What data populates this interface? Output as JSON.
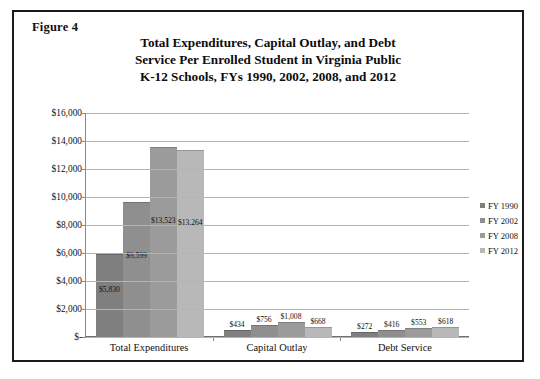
{
  "figure": {
    "label": "Figure 4",
    "title_lines": [
      "Total Expenditures, Capital Outlay, and Debt",
      "Service Per Enrolled Student in Virginia Public",
      "K-12 Schools,  FYs 1990, 2002, 2008, and 2012"
    ]
  },
  "legend": {
    "position": "right",
    "items": [
      {
        "label": "FY 1990",
        "color": "#7f7f7f"
      },
      {
        "label": "FY 2002",
        "color": "#8f8f8f"
      },
      {
        "label": "FY 2008",
        "color": "#9b9b9b"
      },
      {
        "label": "FY 2012",
        "color": "#b8b8b8"
      }
    ]
  },
  "chart_data": {
    "type": "bar",
    "title": "Total Expenditures, Capital Outlay, and Debt Service Per Enrolled Student in Virginia Public K-12 Schools,  FYs 1990, 2002, 2008, and 2012",
    "xlabel": "",
    "ylabel": "",
    "ylim": [
      0,
      16000
    ],
    "grid": true,
    "ytick_labels": [
      "$16,000",
      "$14,000",
      "$12,000",
      "$10,000",
      "$8,000",
      "$6,000",
      "$4,000",
      "$2,000",
      "$-"
    ],
    "ytick_values": [
      16000,
      14000,
      12000,
      10000,
      8000,
      6000,
      4000,
      2000,
      0
    ],
    "categories": [
      "Total Expenditures",
      "Capital Outlay",
      "Debt Service"
    ],
    "series": [
      {
        "name": "FY 1990",
        "color": "#7f7f7f",
        "values": [
          5830,
          434,
          272
        ],
        "labels": [
          "$5,830",
          "$434",
          "$272"
        ]
      },
      {
        "name": "FY 2002",
        "color": "#8f8f8f",
        "values": [
          9599,
          756,
          416
        ],
        "labels": [
          "$9,599",
          "$756",
          "$416"
        ]
      },
      {
        "name": "FY 2008",
        "color": "#9b9b9b",
        "values": [
          13523,
          1008,
          553
        ],
        "labels": [
          "$13,523",
          "$1,008",
          "$553"
        ]
      },
      {
        "name": "FY 2012",
        "color": "#b8b8b8",
        "values": [
          13264,
          668,
          618
        ],
        "labels": [
          "$13,264",
          "$668",
          "$618"
        ]
      }
    ]
  }
}
